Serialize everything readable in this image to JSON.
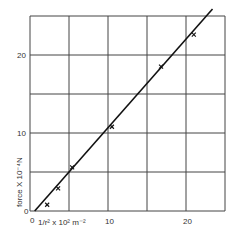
{
  "chart_data": {
    "type": "scatter",
    "title": "",
    "xlabel": "1/r² x 10² m⁻²",
    "ylabel": "force  X 10⁻⁴N",
    "xlim": [
      0,
      25
    ],
    "ylim": [
      0,
      25
    ],
    "grid": true,
    "x_ticks": [
      "0",
      "10",
      "20"
    ],
    "y_ticks": [
      "0",
      "10",
      "20"
    ],
    "series": [
      {
        "name": "measured",
        "marker": "x",
        "points": [
          {
            "x": 2.2,
            "y": 0.8
          },
          {
            "x": 3.6,
            "y": 2.9
          },
          {
            "x": 5.4,
            "y": 5.6
          },
          {
            "x": 10.5,
            "y": 10.8
          },
          {
            "x": 16.8,
            "y": 18.5
          },
          {
            "x": 21.0,
            "y": 22.6
          }
        ]
      },
      {
        "name": "best fit line",
        "type": "line",
        "points": [
          {
            "x": 0.6,
            "y": 0
          },
          {
            "x": 23.4,
            "y": 25.9
          }
        ]
      }
    ]
  },
  "labels": {
    "x_axis": "1/r² x 10² m⁻²",
    "y_axis": "force  X 10⁻⁴N",
    "origin_x": "0",
    "origin_y": "0",
    "x10": "10",
    "x20": "20",
    "y10": "10",
    "y20": "20"
  }
}
